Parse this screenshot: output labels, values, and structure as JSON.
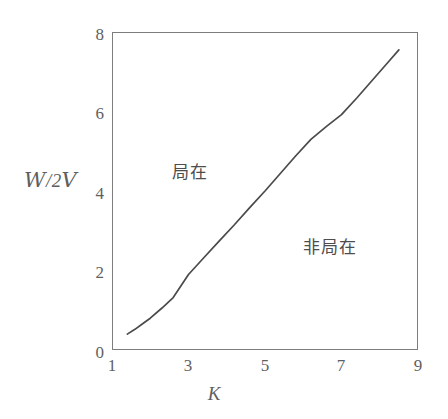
{
  "figure": {
    "background_color": "#ffffff",
    "frame_color": "#7d7d7d",
    "text_color": "#5f5f5f",
    "curve_color": "#4a4a4a"
  },
  "axes": {
    "y_title": "W/2V",
    "y_title_numerator": "W",
    "y_title_separator": "/2",
    "y_title_denominator": "V",
    "x_title": "K",
    "y_ticks": [
      "0",
      "2",
      "4",
      "6",
      "8"
    ],
    "x_ticks": [
      "1",
      "3",
      "5",
      "7",
      "9"
    ]
  },
  "annotations": {
    "localized": "局在",
    "delocalized": "非局在"
  },
  "caption": {
    "fragment": ""
  },
  "chart_data": {
    "type": "line",
    "title": "",
    "subtitle": "",
    "xlabel": "K",
    "ylabel": "W/2V",
    "xlim": [
      1,
      9
    ],
    "ylim": [
      0,
      8
    ],
    "xticks": [
      1,
      3,
      5,
      7,
      9
    ],
    "yticks": [
      0,
      2,
      4,
      6,
      8
    ],
    "grid": false,
    "legend": null,
    "series": [
      {
        "name": "phase boundary",
        "x": [
          1.4,
          1.6,
          1.8,
          2.0,
          2.3,
          2.6,
          3.0,
          3.4,
          3.8,
          4.2,
          4.6,
          5.0,
          5.4,
          5.8,
          6.2,
          6.6,
          7.0,
          7.4,
          7.8,
          8.2,
          8.5
        ],
        "y": [
          0.4,
          0.52,
          0.66,
          0.8,
          1.05,
          1.32,
          1.9,
          2.32,
          2.74,
          3.15,
          3.58,
          4.0,
          4.44,
          4.88,
          5.3,
          5.62,
          5.92,
          6.34,
          6.78,
          7.22,
          7.55
        ]
      }
    ],
    "annotations": [
      {
        "text": "局在",
        "x": 2.6,
        "y": 4.9
      },
      {
        "text": "非局在",
        "x": 6.2,
        "y": 3.0
      }
    ]
  }
}
